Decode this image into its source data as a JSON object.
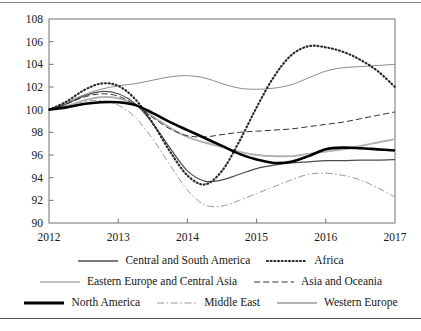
{
  "chart_data": {
    "type": "line",
    "title": "",
    "xlabel": "",
    "ylabel": "",
    "xlim": [
      2012,
      2017
    ],
    "ylim": [
      90,
      108
    ],
    "grid": false,
    "legend_position": "bottom",
    "x_ticks": [
      "2012",
      "2013",
      "2014",
      "2015",
      "2016",
      "2017"
    ],
    "y_ticks": [
      "90",
      "92",
      "94",
      "96",
      "98",
      "100",
      "102",
      "104",
      "106",
      "108"
    ],
    "x": [
      2012,
      2012.25,
      2012.5,
      2012.75,
      2013,
      2013.25,
      2013.5,
      2013.75,
      2014,
      2014.25,
      2014.5,
      2014.75,
      2015,
      2015.25,
      2015.5,
      2015.75,
      2016,
      2016.25,
      2016.5,
      2016.75,
      2017
    ],
    "series": [
      {
        "name": "Central and South America",
        "style": "solid",
        "width": 1.2,
        "color": "#4d4d4d",
        "values": [
          100.0,
          100.5,
          101.2,
          101.6,
          101.4,
          100.5,
          98.8,
          96.6,
          94.6,
          93.7,
          93.8,
          94.3,
          94.8,
          95.1,
          95.3,
          95.4,
          95.5,
          95.5,
          95.55,
          95.55,
          95.6
        ]
      },
      {
        "name": "Africa",
        "style": "dotted",
        "width": 2.2,
        "color": "#2b2b2b",
        "values": [
          100.0,
          100.7,
          101.7,
          102.3,
          102.1,
          100.9,
          98.8,
          96.3,
          94.2,
          93.4,
          94.6,
          97.2,
          100.2,
          102.9,
          104.8,
          105.6,
          105.5,
          105.1,
          104.4,
          103.4,
          102.0
        ]
      },
      {
        "name": "Eastern Europe and Central Asia",
        "style": "solid",
        "width": 0.8,
        "color": "#6f6f6f",
        "values": [
          100.0,
          100.6,
          101.3,
          101.8,
          102.1,
          102.3,
          102.6,
          102.9,
          103.0,
          102.8,
          102.3,
          101.9,
          101.8,
          101.9,
          102.2,
          102.8,
          103.4,
          103.7,
          103.8,
          103.9,
          104.0
        ]
      },
      {
        "name": "Asia and Oceania",
        "style": "dashed",
        "width": 1.0,
        "color": "#333333",
        "values": [
          100.0,
          100.5,
          101.1,
          101.4,
          101.2,
          100.4,
          99.3,
          98.3,
          97.7,
          97.6,
          97.8,
          98.0,
          98.1,
          98.2,
          98.3,
          98.5,
          98.7,
          98.9,
          99.2,
          99.5,
          99.8
        ]
      },
      {
        "name": "North America",
        "style": "solid",
        "width": 2.6,
        "color": "#000000",
        "values": [
          100.0,
          100.2,
          100.5,
          100.65,
          100.65,
          100.4,
          99.7,
          98.9,
          98.2,
          97.5,
          96.8,
          96.1,
          95.6,
          95.3,
          95.4,
          95.9,
          96.5,
          96.65,
          96.6,
          96.5,
          96.4
        ]
      },
      {
        "name": "Middle East",
        "style": "dashdot",
        "width": 1.0,
        "color": "#999999",
        "values": [
          100.0,
          100.3,
          100.7,
          100.8,
          100.4,
          99.3,
          97.4,
          95.1,
          92.9,
          91.6,
          91.5,
          92.0,
          92.6,
          93.2,
          93.8,
          94.3,
          94.4,
          94.2,
          93.8,
          93.1,
          92.3
        ]
      },
      {
        "name": "Western Europe",
        "style": "solid",
        "width": 2.0,
        "color": "#b3b3b3",
        "values": [
          100.0,
          100.3,
          100.8,
          101.1,
          101.0,
          100.4,
          99.4,
          98.4,
          97.6,
          97.1,
          96.7,
          96.3,
          96.0,
          95.9,
          95.9,
          96.1,
          96.3,
          96.5,
          96.8,
          97.1,
          97.4
        ]
      }
    ]
  },
  "legend": {
    "rows": [
      [
        {
          "label": "Central and South America",
          "style": "solid",
          "width": 1.6,
          "color": "#4d4d4d"
        },
        {
          "label": "Africa",
          "style": "dotted",
          "width": 2.2,
          "color": "#2b2b2b"
        }
      ],
      [
        {
          "label": "Eastern Europe and Central Asia",
          "style": "solid",
          "width": 0.9,
          "color": "#6f6f6f"
        },
        {
          "label": "Asia and Oceania",
          "style": "dashed",
          "width": 1.1,
          "color": "#333333"
        }
      ],
      [
        {
          "label": "North America",
          "style": "solid",
          "width": 2.8,
          "color": "#000000"
        },
        {
          "label": "Middle East",
          "style": "dashdot",
          "width": 1.1,
          "color": "#999999"
        },
        {
          "label": "Western Europe",
          "style": "solid",
          "width": 2.2,
          "color": "#b3b3b3"
        }
      ]
    ]
  }
}
